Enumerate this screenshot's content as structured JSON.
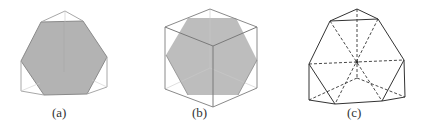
{
  "figures": [
    {
      "id": "a",
      "label": "(a)",
      "description": "Truncated cube projection with shaded hexagon cross-section",
      "colors": {
        "outline": "#aaaaaa",
        "fill": "#b3b3b3",
        "hex_edge": "#8a8a8a"
      }
    },
    {
      "id": "b",
      "label": "(b)",
      "description": "Cube with shaded regular hexagonal cross-section",
      "colors": {
        "outline": "#8a8a8a",
        "fill": "#bdbdbd"
      }
    },
    {
      "id": "c",
      "label": "(c)",
      "description": "Polyhedron wireframe with dashed hidden edges meeting at center",
      "colors": {
        "solid": "#333333",
        "dashed": "#333333"
      }
    }
  ]
}
